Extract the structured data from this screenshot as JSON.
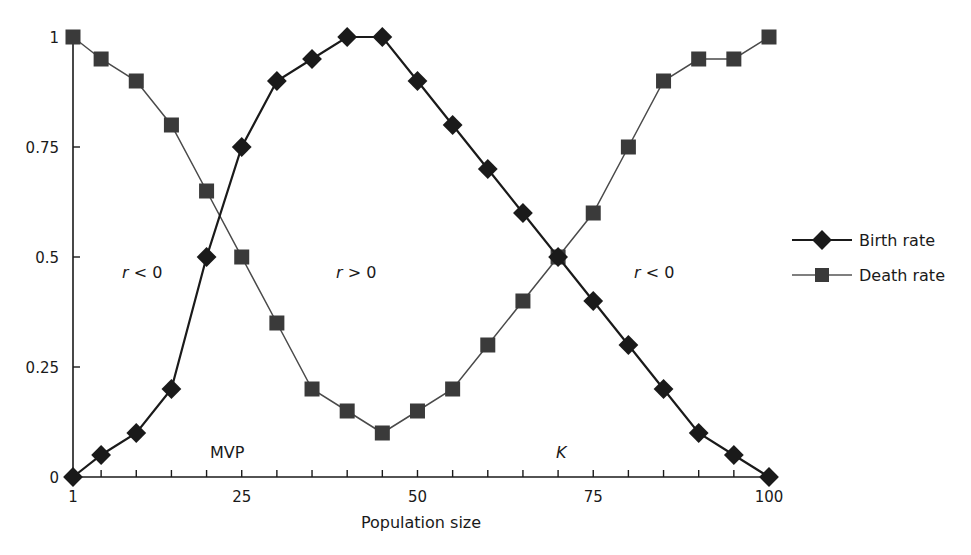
{
  "chart_data": {
    "type": "line",
    "title": "",
    "xlabel": "Population size",
    "ylabel": "",
    "x": [
      1,
      5,
      10,
      15,
      20,
      25,
      30,
      35,
      40,
      45,
      50,
      55,
      60,
      65,
      70,
      75,
      80,
      85,
      90,
      95,
      100
    ],
    "series": [
      {
        "name": "Birth rate",
        "marker": "diamond",
        "color": "#1a1a1a",
        "values": [
          0,
          0.05,
          0.1,
          0.2,
          0.5,
          0.75,
          0.9,
          0.95,
          1,
          1,
          0.9,
          0.8,
          0.7,
          0.6,
          0.5,
          0.4,
          0.3,
          0.2,
          0.1,
          0.05,
          0
        ]
      },
      {
        "name": "Death rate",
        "marker": "square",
        "color": "#3a3a3a",
        "values": [
          1,
          0.95,
          0.9,
          0.8,
          0.65,
          0.5,
          0.35,
          0.2,
          0.15,
          0.1,
          0.15,
          0.2,
          0.3,
          0.4,
          0.5,
          0.6,
          0.75,
          0.9,
          0.95,
          0.95,
          1
        ]
      }
    ],
    "xlim": [
      1,
      100
    ],
    "ylim": [
      0,
      1
    ],
    "x_ticks": [
      1,
      25,
      50,
      75,
      100
    ],
    "x_minor_ticks_step": 5,
    "y_ticks": [
      0,
      0.25,
      0.5,
      0.75,
      1
    ],
    "y_tick_labels": [
      "0",
      "0.25",
      "0.5",
      "0.75",
      "1"
    ],
    "grid": false,
    "legend_position": "right",
    "annotations": [
      {
        "text": "r < 0",
        "x": 11,
        "y": 0.5,
        "italic_r": true
      },
      {
        "text": "r > 0",
        "x": 47,
        "y": 0.5,
        "italic_r": true
      },
      {
        "text": "r < 0",
        "x": 87,
        "y": 0.5,
        "italic_r": true
      },
      {
        "text": "MVP",
        "x": 23,
        "y": 0.07
      },
      {
        "text": "K",
        "x": 70,
        "y": 0.07,
        "italic": true
      }
    ]
  },
  "legend": {
    "items": [
      {
        "label": "Birth rate",
        "marker": "diamond"
      },
      {
        "label": "Death rate",
        "marker": "square"
      }
    ]
  },
  "labels": {
    "x_axis_title": "Population size",
    "mvp": "MVP",
    "k": "K",
    "r_left_var": "r",
    "r_left_rel": " < 0",
    "r_mid_var": "r",
    "r_mid_rel": " > 0",
    "r_right_var": "r",
    "r_right_rel": " < 0"
  }
}
